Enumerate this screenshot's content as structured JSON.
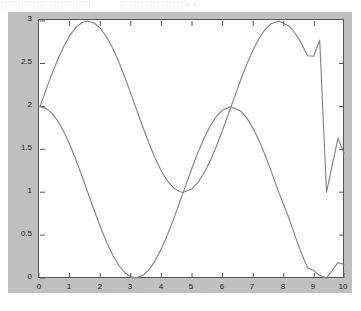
{
  "window": {
    "toolbar_visible": true
  },
  "caption": {
    "text": ""
  },
  "figure": {
    "panel_color": "#c0c0c0",
    "axes_bg_color": "#ffffff",
    "axes_line_color": "#555555",
    "line_color": "#808080"
  },
  "chart_data": {
    "type": "line",
    "title": "",
    "xlabel": "",
    "ylabel": "",
    "xlim": [
      0,
      10
    ],
    "ylim": [
      0,
      3
    ],
    "xticks": [
      0,
      1,
      2,
      3,
      4,
      5,
      6,
      7,
      8,
      9,
      10
    ],
    "xticklabels": [
      "0",
      "1",
      "2",
      "3",
      "4",
      "5",
      "6",
      "7",
      "8",
      "9",
      "10"
    ],
    "yticks": [
      0,
      0.5,
      1,
      1.5,
      2,
      2.5,
      3
    ],
    "yticklabels": [
      "0",
      "0.5",
      "1",
      "1.5",
      "2",
      "2.5",
      "3"
    ],
    "grid": false,
    "legend": null,
    "series": [
      {
        "name": "curve-1",
        "formula": "2 + sin(x)",
        "color": "#808080",
        "x": [
          0,
          0.2,
          0.4,
          0.6,
          0.8,
          1,
          1.2,
          1.4,
          1.5708,
          1.8,
          2,
          2.2,
          2.4,
          2.6,
          2.8,
          3,
          3.1416,
          3.4,
          3.6,
          3.8,
          4,
          4.2,
          4.4,
          4.6,
          4.7124,
          5,
          5.2,
          5.4,
          5.6,
          5.8,
          6,
          6.2832,
          6.6,
          6.8,
          7,
          7.2,
          7.4,
          7.6,
          7.854,
          8.2,
          8.4,
          8.6,
          8.8,
          9,
          9.2,
          9.4248,
          9.8,
          10
        ],
        "y": [
          2,
          2.199,
          2.389,
          2.565,
          2.717,
          2.841,
          2.932,
          2.985,
          3,
          2.974,
          2.909,
          2.808,
          2.675,
          2.516,
          2.335,
          2.141,
          2,
          1.745,
          1.558,
          1.388,
          1.243,
          1.128,
          1.049,
          1.006,
          1,
          1.041,
          1.117,
          1.228,
          1.369,
          1.535,
          1.721,
          2,
          2.311,
          2.494,
          2.657,
          2.793,
          2.899,
          2.969,
          3,
          2.939,
          2.854,
          2.737,
          2.595,
          2.588,
          2.777,
          1,
          1.634,
          1.456
        ]
      },
      {
        "name": "curve-2",
        "formula": "1 + cos(x)",
        "color": "#808080",
        "x": [
          0,
          0.2,
          0.4,
          0.6,
          0.8,
          1,
          1.2,
          1.4,
          1.5708,
          1.8,
          2,
          2.2,
          2.4,
          2.6,
          2.8,
          3,
          3.1416,
          3.4,
          3.6,
          3.8,
          4,
          4.2,
          4.4,
          4.6,
          4.7124,
          5,
          5.2,
          5.4,
          5.6,
          5.8,
          6,
          6.2832,
          6.6,
          6.8,
          7,
          7.2,
          7.4,
          7.6,
          7.854,
          8.2,
          8.4,
          8.6,
          8.8,
          9,
          9.2,
          9.4248,
          9.8,
          10
        ],
        "y": [
          2,
          1.98,
          1.921,
          1.825,
          1.697,
          1.54,
          1.362,
          1.17,
          1,
          0.773,
          0.584,
          0.411,
          0.263,
          0.143,
          0.058,
          0.01,
          0,
          0.033,
          0.104,
          0.209,
          0.346,
          0.51,
          0.693,
          0.888,
          1,
          1.284,
          1.469,
          1.635,
          1.775,
          1.886,
          1.96,
          2,
          1.95,
          1.869,
          1.754,
          1.609,
          1.439,
          1.251,
          1,
          0.688,
          0.48,
          0.287,
          0.121,
          0.089,
          0.028,
          0,
          0.179,
          0.161
        ]
      }
    ]
  }
}
